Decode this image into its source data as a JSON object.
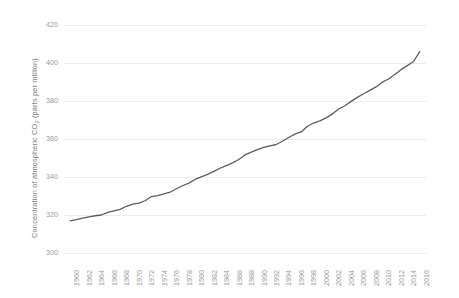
{
  "chart_data": {
    "type": "line",
    "title": "",
    "subtitle": "",
    "xlabel": "",
    "ylabel": "Concentration of atmospheric CO2 (parts per million)",
    "ylabel_prefix": "Concentration of atmospheric CO",
    "ylabel_subscript": "2",
    "ylabel_suffix": " (parts per million)",
    "xlim": [
      1959,
      2017
    ],
    "ylim": [
      300,
      420
    ],
    "y_ticks": [
      300,
      320,
      340,
      360,
      380,
      400,
      420
    ],
    "y_tick_labels": [
      "300",
      "320",
      "340",
      "360",
      "380",
      "400",
      "420"
    ],
    "x_ticks": [
      1960,
      1962,
      1964,
      1966,
      1968,
      1970,
      1972,
      1974,
      1976,
      1978,
      1980,
      1982,
      1984,
      1986,
      1988,
      1990,
      1992,
      1994,
      1996,
      1998,
      2000,
      2002,
      2004,
      2006,
      2008,
      2010,
      2012,
      2014,
      2016
    ],
    "x_tick_labels": [
      "1960",
      "1962",
      "1964",
      "1966",
      "1968",
      "1970",
      "1972",
      "1974",
      "1976",
      "1978",
      "1980",
      "1982",
      "1984",
      "1986",
      "1988",
      "1990",
      "1992",
      "1994",
      "1996",
      "1998",
      "2000",
      "2002",
      "2004",
      "2006",
      "2008",
      "2010",
      "2012",
      "2014",
      "2016"
    ],
    "grid": {
      "horizontal": true,
      "vertical": false
    },
    "legend": {
      "visible": false,
      "position": "none"
    },
    "line_color": "#5c5c5c",
    "grid_color": "#ececec",
    "tick_color": "#9a9a9a",
    "axis_label_color": "#7b7b7b",
    "background_color": "#ffffff",
    "series": [
      {
        "name": "Atmospheric CO2",
        "x": [
          1960,
          1961,
          1962,
          1963,
          1964,
          1965,
          1966,
          1967,
          1968,
          1969,
          1970,
          1971,
          1972,
          1973,
          1974,
          1975,
          1976,
          1977,
          1978,
          1979,
          1980,
          1981,
          1982,
          1983,
          1984,
          1985,
          1986,
          1987,
          1988,
          1989,
          1990,
          1991,
          1992,
          1993,
          1994,
          1995,
          1996,
          1997,
          1998,
          1999,
          2000,
          2001,
          2002,
          2003,
          2004,
          2005,
          2006,
          2007,
          2008,
          2009,
          2010,
          2011,
          2012,
          2013,
          2014,
          2015,
          2016
        ],
        "values": [
          316.9,
          317.6,
          318.4,
          319.0,
          319.6,
          320.0,
          321.4,
          322.2,
          323.0,
          324.6,
          325.7,
          326.3,
          327.5,
          329.7,
          330.2,
          331.1,
          332.0,
          333.8,
          335.4,
          336.8,
          338.7,
          340.1,
          341.4,
          343.0,
          344.6,
          346.0,
          347.4,
          349.2,
          351.6,
          353.1,
          354.4,
          355.6,
          356.4,
          357.1,
          358.8,
          360.8,
          362.6,
          363.7,
          366.7,
          368.4,
          369.5,
          371.1,
          373.2,
          375.8,
          377.5,
          379.8,
          381.9,
          383.8,
          385.6,
          387.4,
          389.9,
          391.6,
          393.9,
          396.5,
          398.6,
          400.8,
          406.0
        ]
      }
    ]
  }
}
